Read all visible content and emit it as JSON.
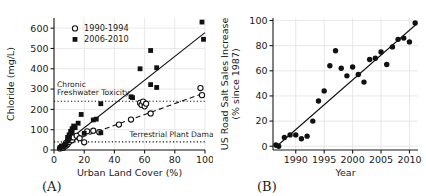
{
  "figure": {
    "panel_a_label": "(A)",
    "panel_b_label": "(B)"
  },
  "chart_data": [
    {
      "id": "panel-a",
      "type": "scatter",
      "title": "",
      "xlabel": "Urban Land Cover (%)",
      "ylabel": "Chloride (mg/L)",
      "xlim": [
        0,
        100
      ],
      "ylim": [
        0,
        650
      ],
      "xticks": [
        0,
        20,
        40,
        60,
        80,
        100
      ],
      "yticks": [
        0,
        100,
        200,
        300,
        400,
        500,
        600
      ],
      "grid": true,
      "legend_position": "upper-left",
      "series": [
        {
          "name": "1990-1994",
          "marker": "open-circle",
          "points": [
            [
              4,
              8
            ],
            [
              5,
              12
            ],
            [
              6,
              10
            ],
            [
              7,
              18
            ],
            [
              8,
              22
            ],
            [
              8,
              35
            ],
            [
              9,
              28
            ],
            [
              10,
              40
            ],
            [
              11,
              55
            ],
            [
              12,
              48
            ],
            [
              13,
              62
            ],
            [
              15,
              70
            ],
            [
              17,
              58
            ],
            [
              20,
              38
            ],
            [
              22,
              92
            ],
            [
              26,
              95
            ],
            [
              30,
              88
            ],
            [
              43,
              125
            ],
            [
              51,
              150
            ],
            [
              57,
              232
            ],
            [
              58,
              222
            ],
            [
              59,
              238
            ],
            [
              60,
              215
            ],
            [
              61,
              228
            ],
            [
              64,
              180
            ],
            [
              97,
              305
            ],
            [
              98,
              270
            ]
          ],
          "trend": {
            "style": "dashed",
            "x0": 3,
            "y0": 22,
            "x1": 100,
            "y1": 282
          }
        },
        {
          "name": "2006-2010",
          "marker": "filled-square",
          "points": [
            [
              4,
              12
            ],
            [
              5,
              20
            ],
            [
              6,
              15
            ],
            [
              7,
              25
            ],
            [
              8,
              30
            ],
            [
              9,
              45
            ],
            [
              9,
              62
            ],
            [
              10,
              75
            ],
            [
              10,
              55
            ],
            [
              11,
              92
            ],
            [
              12,
              85
            ],
            [
              12,
              105
            ],
            [
              13,
              118
            ],
            [
              14,
              110
            ],
            [
              16,
              132
            ],
            [
              18,
              175
            ],
            [
              20,
              82
            ],
            [
              26,
              148
            ],
            [
              28,
              152
            ],
            [
              31,
              228
            ],
            [
              31,
              85
            ],
            [
              51,
              262
            ],
            [
              52,
              258
            ],
            [
              57,
              400
            ],
            [
              64,
              490
            ],
            [
              64,
              322
            ],
            [
              68,
              405
            ],
            [
              68,
              308
            ],
            [
              98,
              630
            ],
            [
              99,
              545
            ]
          ],
          "trend": {
            "style": "solid",
            "x0": 3,
            "y0": 10,
            "x1": 100,
            "y1": 578
          }
        }
      ],
      "thresholds": [
        {
          "label_lines": [
            "Chronic",
            "Freshwater Toxicity"
          ],
          "value": 240,
          "label_x": 2,
          "label_anchor": "start",
          "label_offset_y": -6
        },
        {
          "label_lines": [
            "Terrestrial Plant Damage"
          ],
          "value": 40,
          "label_x": 50,
          "label_anchor": "start",
          "label_offset_y": -5
        }
      ]
    },
    {
      "id": "panel-b",
      "type": "scatter",
      "title": "",
      "xlabel": "Year",
      "ylabel_lines": [
        "US Road Salt Sales Increase",
        "(% since 1987)"
      ],
      "xlim": [
        1986,
        2011.5
      ],
      "ylim": [
        -3,
        102
      ],
      "xticks": [
        1990,
        1995,
        2000,
        2005,
        2010
      ],
      "yticks": [
        0,
        20,
        40,
        60,
        80,
        100
      ],
      "grid": true,
      "series": [
        {
          "name": "US Road Salt Sales",
          "marker": "filled-circle",
          "points": [
            [
              1986.5,
              1
            ],
            [
              1987,
              0
            ],
            [
              1988,
              7
            ],
            [
              1989,
              9
            ],
            [
              1990,
              9
            ],
            [
              1991,
              6
            ],
            [
              1992,
              8
            ],
            [
              1993,
              20
            ],
            [
              1994,
              36
            ],
            [
              1995,
              44
            ],
            [
              1996,
              64
            ],
            [
              1997,
              76
            ],
            [
              1998,
              62
            ],
            [
              1999,
              56
            ],
            [
              2000,
              63
            ],
            [
              2001,
              57
            ],
            [
              2002,
              51
            ],
            [
              2003,
              69
            ],
            [
              2004,
              70
            ],
            [
              2005,
              75
            ],
            [
              2006,
              65
            ],
            [
              2007,
              79
            ],
            [
              2008,
              85
            ],
            [
              2009,
              86
            ],
            [
              2010,
              83
            ],
            [
              2011,
              98
            ]
          ],
          "trend": {
            "style": "solid",
            "x0": 1986.4,
            "y0": -1,
            "x1": 2011.2,
            "y1": 97
          }
        }
      ]
    }
  ]
}
